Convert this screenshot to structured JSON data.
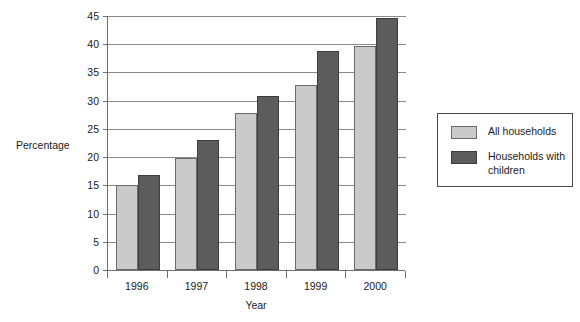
{
  "chart_data": {
    "type": "bar",
    "title": "",
    "subtitle": "",
    "xlabel": "Year",
    "ylabel": "Percentage",
    "categories": [
      "1996",
      "1997",
      "1998",
      "1999",
      "2000"
    ],
    "series": [
      {
        "name": "All households",
        "color": "#cacaca",
        "values": [
          15.0,
          19.8,
          27.9,
          32.8,
          39.7
        ]
      },
      {
        "name": "Households with children",
        "color": "#5c5c5c",
        "values": [
          16.9,
          23.0,
          30.8,
          38.8,
          44.6
        ]
      }
    ],
    "ylim": [
      0,
      45
    ],
    "ytick_step": 5,
    "yticks": [
      "0",
      "5",
      "10",
      "15",
      "20",
      "25",
      "30",
      "35",
      "40",
      "45"
    ],
    "grid": true,
    "legend_position": "right"
  }
}
